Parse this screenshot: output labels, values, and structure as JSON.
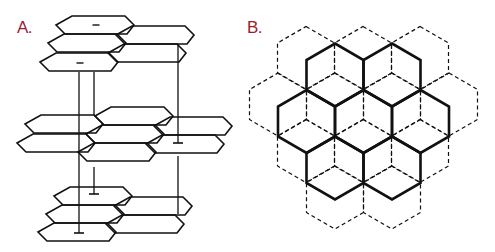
{
  "colors": {
    "label": "#9b1b30",
    "stroke": "#111111",
    "background": "#ffffff"
  },
  "panel_a": {
    "label": "A.",
    "description": "Three stacked honeycomb layers in perspective connected by vertical lines",
    "hex_shape": [
      [
        0,
        0
      ],
      [
        16,
        -9
      ],
      [
        69,
        -9
      ],
      [
        78,
        0
      ],
      [
        71,
        9
      ],
      [
        9,
        9
      ]
    ],
    "layers": [
      {
        "name": "top-layer",
        "hexes": [
          [
            56,
            25
          ],
          [
            116,
            35
          ],
          [
            48,
            43
          ],
          [
            108,
            53
          ],
          [
            40,
            62
          ]
        ]
      },
      {
        "name": "middle-layer",
        "hexes": [
          [
            95,
            116
          ],
          [
            25,
            124
          ],
          [
            154,
            126
          ],
          [
            86,
            134
          ],
          [
            17,
            143
          ],
          [
            146,
            144
          ],
          [
            78,
            152
          ]
        ]
      },
      {
        "name": "bottom-layer",
        "hexes": [
          [
            54,
            196
          ],
          [
            114,
            206
          ],
          [
            46,
            214
          ],
          [
            106,
            224
          ],
          [
            38,
            232
          ]
        ]
      }
    ],
    "minus_signs": [
      [
        96,
        25
      ],
      [
        80,
        63
      ]
    ],
    "connectors": [
      {
        "x": 79,
        "y1": 72,
        "y2": 233,
        "bar": true
      },
      {
        "x": 94,
        "y1": 72,
        "y2": 115,
        "bar": false
      },
      {
        "x": 94,
        "y1": 167,
        "y2": 194,
        "bar": true
      },
      {
        "x": 178,
        "y1": 44,
        "y2": 143,
        "bar": true
      },
      {
        "x": 178,
        "y1": 156,
        "y2": 214,
        "bar": false
      }
    ]
  },
  "panel_b": {
    "label": "B.",
    "description": "Two overlapping hexagonal lattices: solid top layer and dashed offset layer",
    "hex": {
      "half_width": 28.5,
      "side_half": 15,
      "tip": 16.5
    },
    "solid_centers": [
      [
        335,
        75
      ],
      [
        392,
        75
      ],
      [
        306.5,
        121.5
      ],
      [
        363.5,
        121.5
      ],
      [
        420.5,
        121.5
      ],
      [
        335,
        168
      ],
      [
        392,
        168
      ]
    ],
    "dashed_centers": [
      [
        306,
        58
      ],
      [
        363,
        58
      ],
      [
        420,
        58
      ],
      [
        278,
        104.5
      ],
      [
        335,
        104.5
      ],
      [
        392,
        104.5
      ],
      [
        449,
        104.5
      ],
      [
        306,
        151
      ],
      [
        363,
        151
      ],
      [
        420,
        151
      ],
      [
        335,
        197.5
      ],
      [
        392,
        197.5
      ]
    ]
  }
}
